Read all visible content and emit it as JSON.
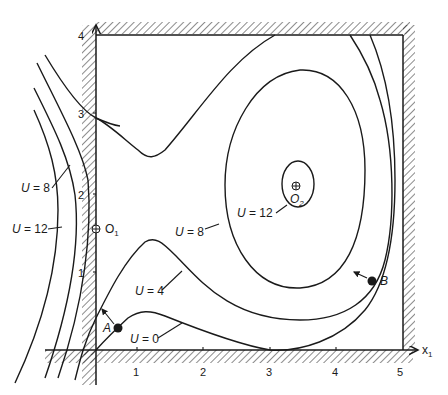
{
  "figure": {
    "type": "contour diagram"
  },
  "axes": {
    "x_label_main": "x",
    "x_label_sub": "1",
    "x_ticks": [
      "1",
      "2",
      "3",
      "4",
      "5"
    ],
    "y_ticks": [
      "1",
      "2",
      "3",
      "4"
    ]
  },
  "contour_labels": {
    "u0": {
      "var": "U",
      "eq": " = 0"
    },
    "u4": {
      "var": "U",
      "eq": " = 4"
    },
    "u8_center": {
      "var": "U",
      "eq": " = 8"
    },
    "u12_center": {
      "var": "U",
      "eq": " = 12"
    },
    "u8_left": {
      "var": "U",
      "eq": " = 8"
    },
    "u12_left": {
      "var": "U",
      "eq": " = 12"
    }
  },
  "points": {
    "o1": {
      "main": "O",
      "sub": "1"
    },
    "o2": {
      "main": "O",
      "sub": "2"
    },
    "a": {
      "label": "A"
    },
    "b": {
      "label": "B"
    }
  },
  "colors": {
    "ink": "#1a1a1a",
    "background": "#ffffff"
  }
}
